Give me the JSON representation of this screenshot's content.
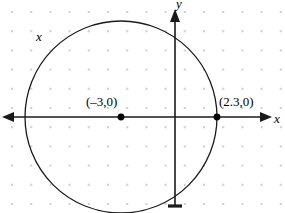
{
  "figure": {
    "type": "coordinate-plane-circle-diagram",
    "background_color": "#ffffff",
    "width": 285,
    "height": 213
  },
  "axes": {
    "x_axis_label": "x",
    "x_axis_label_secondary": "x",
    "y_axis_label": "y",
    "axis_color": "#1a1a1a",
    "origin": {
      "x": 175,
      "y": 117
    },
    "x_axis": {
      "start_x": 2,
      "end_x": 272,
      "y": 117,
      "arrow_left": true,
      "arrow_right": true
    },
    "y_axis": {
      "x": 175,
      "start_y": 10,
      "end_y": 207,
      "arrow_up": true,
      "tick_bottom": true
    }
  },
  "grid": {
    "dot_color": "#cfcfcf",
    "dot_size": 2,
    "spacing": 19.2,
    "offset_x": 12,
    "offset_y": 12
  },
  "circle": {
    "center": {
      "x": 121,
      "y": 117
    },
    "radius": 96,
    "stroke_color": "#1a1a1a",
    "stroke_width": 1.3,
    "fill": "none"
  },
  "points": [
    {
      "name": "left-point",
      "label": "(–3,0)",
      "cx": 121,
      "cy": 117,
      "r": 3.4,
      "color": "#000000"
    },
    {
      "name": "right-point",
      "label": "(2.3,0)",
      "cx": 217,
      "cy": 117,
      "r": 3.4,
      "color": "#000000"
    }
  ],
  "chart_data": {
    "type": "scatter",
    "title": "",
    "xlabel": "x",
    "ylabel": "y",
    "grid": true,
    "legend": null,
    "annotations": [
      "(–3,0)",
      "(2.3,0)",
      "x",
      "x",
      "y"
    ],
    "shapes": [
      {
        "kind": "circle",
        "center_label": "(–3,0)",
        "center_x": -3,
        "center_y": 0,
        "passes_through_x": 2.3,
        "radius_units": 5.3
      }
    ],
    "points": [
      {
        "label": "(–3,0)",
        "x": -3,
        "y": 0
      },
      {
        "label": "(2.3,0)",
        "x": 2.3,
        "y": 0
      }
    ],
    "xlim": [
      -9.0,
      5.3
    ],
    "ylim": [
      -4.7,
      5.6
    ]
  }
}
